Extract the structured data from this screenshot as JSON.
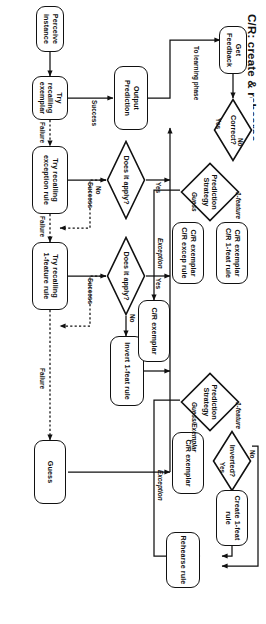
{
  "figure": {
    "title": "C/R: create & rehearse",
    "orientation": "rotated-90-clockwise"
  },
  "nodes": {
    "perceive_instance": "Perceive instance",
    "try_recalling_exemplar": "Try recalling\nexemplar",
    "try_recalling_exception_rule": "Try recalling\nexception rule",
    "try_recalling_1feature_rule": "Try recalling\n1-feature rule",
    "guess": "Guess",
    "does_it_apply_1": "Does it apply?",
    "does_it_apply_2": "Does it apply?",
    "invert_1feat_rule": "Invert 1-feat rule",
    "output_prediction": "Output Prediction",
    "get_feedback": "Get Feedback",
    "correct": "Correct?",
    "prediction_strategy_incorrect": "Prediction\nStrategy",
    "prediction_strategy_correct": "Prediction\nStrategy",
    "cr_exemplar_1feat_rule": "C/R exemplar\nC/R 1-feat rule",
    "cr_exemplar_excep_rule": "C/R exemplar\nC/R excep rule",
    "cr_exemplar_exception": "C/R exemplar",
    "cr_exemplar_guess": "C/R exemplar",
    "inverted": "Inverted?",
    "create_1feat_rule": "Create 1-feat rule",
    "rehearse_rule": "Rehearse rule"
  },
  "edge_labels": {
    "to_learning_phase": "To learning phase",
    "success_exemplar": "Success",
    "failure_exemplar": "Failure",
    "success_exception": "Success",
    "failure_exception": "Failure",
    "success_1feature": "Success",
    "failure_1feature": "Failure",
    "yes_apply_1": "Yes",
    "no_apply_1": "No",
    "yes_apply_2": "Yes",
    "no_apply_2": "No",
    "yes_correct": "Yes",
    "no_correct": "No",
    "guess_branch": "Guess",
    "one_feature_branch_incorrect": "1-feature",
    "exception_branch_incorrect": "Exception",
    "guess_exemplar_branch": "Guess/Exemplar",
    "one_feature_branch_correct": "1-feature",
    "exception_branch_correct": "Exception",
    "yes_inverted": "Yes",
    "no_inverted": "No"
  },
  "colors": {
    "stroke": "#111111",
    "background": "#ffffff"
  }
}
